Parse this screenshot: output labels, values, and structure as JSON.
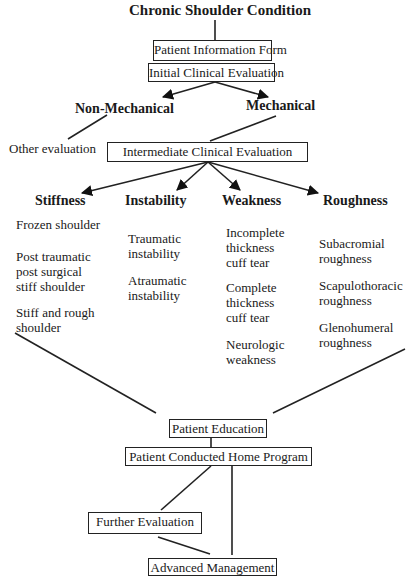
{
  "title": "Chronic Shoulder Condition",
  "nodes": {
    "patient_information_form": "Patient Information Form",
    "initial_clinical_evaluation": "Initial  Clinical Evaluation",
    "non_mechanical": "Non-Mechanical",
    "mechanical": "Mechanical",
    "other_evaluation": "Other evaluation",
    "intermediate_clinical_evaluation": "Intermediate Clinical Evaluation",
    "patient_education": "Patient Education",
    "patient_conducted_home_program": "Patient Conducted Home Program",
    "further_evaluation": "Further Evaluation",
    "advanced_management": "Advanced Management"
  },
  "categories": [
    {
      "label": "Stiffness",
      "items": [
        "Frozen  shoulder",
        "Post traumatic\npost surgical\nstiff shoulder",
        "Stiff and rough\nshoulder"
      ]
    },
    {
      "label": "Instability",
      "items": [
        "Traumatic\ninstability",
        "Atraumatic\ninstability"
      ]
    },
    {
      "label": "Weakness",
      "items": [
        "Incomplete\nthickness\ncuff tear",
        "Complete\nthickness\ncuff tear",
        "Neurologic\nweakness"
      ]
    },
    {
      "label": "Roughness",
      "items": [
        "Subacromial\nroughness",
        "Scapulothoracic\nroughness",
        "Glenohumeral\nroughness"
      ]
    }
  ]
}
